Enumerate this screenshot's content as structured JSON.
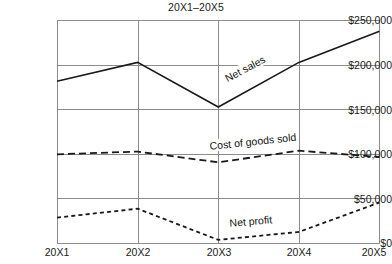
{
  "chart_data": {
    "type": "line",
    "title": "20X1–20X5",
    "xlabel": "",
    "ylabel": "",
    "categories": [
      "20X1",
      "20X2",
      "20X3",
      "20X4",
      "20X5"
    ],
    "ylim": [
      0,
      250000
    ],
    "yticks": [
      0,
      50000,
      100000,
      150000,
      200000,
      250000
    ],
    "ytick_labels": [
      "$0",
      "$50,000",
      "$100,000",
      "$150,000",
      "$200,000",
      "$250,000"
    ],
    "grid": true,
    "legend_position": "inline-annotations",
    "series": [
      {
        "name": "Net sales",
        "style": "solid",
        "color": "#1a1a1a",
        "values": [
          182000,
          203000,
          153000,
          203000,
          238000
        ],
        "annotation": "Net sales"
      },
      {
        "name": "Cost of goods sold",
        "style": "dashed-long",
        "color": "#1a1a1a",
        "values": [
          100000,
          103000,
          91000,
          104000,
          97000
        ],
        "annotation": "Cost of goods sold"
      },
      {
        "name": "Net profit",
        "style": "dashed-short",
        "color": "#1a1a1a",
        "values": [
          29000,
          39000,
          4000,
          13000,
          46000
        ],
        "annotation": "Net profit"
      }
    ]
  },
  "axis": {
    "ytick_labels": [
      "$250,000",
      "$200,000",
      "$150,000",
      "$100,000",
      "$50,000",
      "$0"
    ],
    "xtick_labels": [
      "20X1",
      "20X2",
      "20X3",
      "20X4",
      "20X5"
    ]
  },
  "annotations": {
    "net_sales": "Net sales",
    "cost_of_goods_sold": "Cost of goods sold",
    "net_profit": "Net profit"
  }
}
